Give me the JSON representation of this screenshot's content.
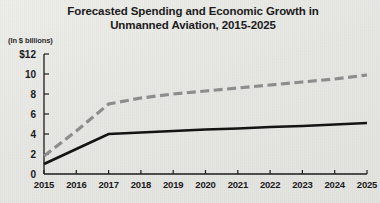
{
  "chart_data": {
    "type": "line",
    "title": "Forecasted Spending and Economic Growth in Unmanned Aviation, 2015-2025",
    "title_line1": "Forecasted Spending and Economic Growth in",
    "title_line2": "Unmanned Aviation, 2015-2025",
    "axis_note": "(In $ billions)",
    "xlabel": "",
    "ylabel": "",
    "ylim": [
      0,
      12
    ],
    "xlim": [
      2015,
      2025
    ],
    "grid": false,
    "legend": "none",
    "y_ticks": [
      0,
      2,
      4,
      6,
      8,
      10,
      12
    ],
    "y_tick_labels": [
      "0",
      "2",
      "4",
      "6",
      "8",
      "10",
      "$12"
    ],
    "categories": [
      "2015",
      "2016",
      "2017",
      "2018",
      "2019",
      "2020",
      "2021",
      "2022",
      "2023",
      "2024",
      "2025"
    ],
    "series": [
      {
        "name": "economic-growth-dashed",
        "style": "dashed",
        "color": "#8d8d8d",
        "values": [
          1.8,
          4.3,
          7.0,
          7.6,
          8.0,
          8.3,
          8.6,
          8.9,
          9.2,
          9.5,
          9.9
        ]
      },
      {
        "name": "spending-solid",
        "style": "solid",
        "color": "#141414",
        "values": [
          1.0,
          2.5,
          4.0,
          4.15,
          4.3,
          4.45,
          4.55,
          4.7,
          4.8,
          4.95,
          5.1
        ]
      }
    ]
  }
}
